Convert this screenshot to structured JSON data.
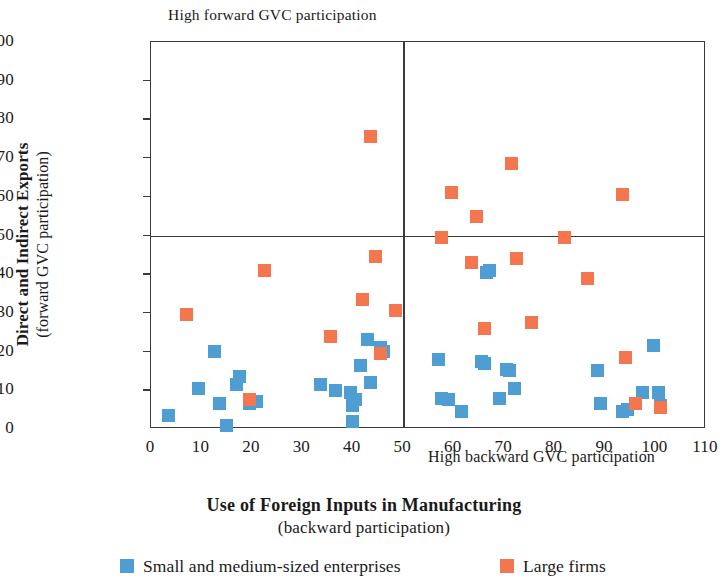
{
  "chart_data": {
    "type": "scatter",
    "title": "",
    "top_annotation": "High forward  GVC participation",
    "x_annotation": "High backward GVC participation",
    "xlabel_bold": "Use of Foreign Inputs in Manufacturing",
    "xlabel_sub": "(backward participation)",
    "ylabel_bold": "Direct and Indirect Exports",
    "ylabel_sub": "(forward GVC participation)",
    "xlim": [
      0,
      110
    ],
    "ylim": [
      0,
      100
    ],
    "xticks": [
      0,
      10,
      20,
      30,
      40,
      50,
      60,
      70,
      80,
      90,
      100,
      110
    ],
    "yticks": [
      0,
      10,
      20,
      30,
      40,
      50,
      60,
      70,
      80,
      90,
      100
    ],
    "grid": false,
    "quadrant_lines": {
      "x": 50,
      "y": 50
    },
    "legend_position": "bottom",
    "colors": {
      "sme": "#4e9ed4",
      "large": "#f4764e",
      "axis": "#3a3a3a"
    },
    "series": [
      {
        "name": "Small and medium-sized enterprises",
        "color": "#4e9ed4",
        "points": [
          [
            3.5,
            3.5
          ],
          [
            9.5,
            10.5
          ],
          [
            12.5,
            20.0
          ],
          [
            13.5,
            6.5
          ],
          [
            15.0,
            1.0
          ],
          [
            17.0,
            11.5
          ],
          [
            17.5,
            13.5
          ],
          [
            19.5,
            6.5
          ],
          [
            21.0,
            7.0
          ],
          [
            33.5,
            11.5
          ],
          [
            36.5,
            10.0
          ],
          [
            39.5,
            9.5
          ],
          [
            40.0,
            2.0
          ],
          [
            40.0,
            6.0
          ],
          [
            40.5,
            7.5
          ],
          [
            41.5,
            16.5
          ],
          [
            43.0,
            23.0
          ],
          [
            43.5,
            12.0
          ],
          [
            45.5,
            21.0
          ],
          [
            46.0,
            20.0
          ],
          [
            57.0,
            18.0
          ],
          [
            57.5,
            8.0
          ],
          [
            59.0,
            7.5
          ],
          [
            61.5,
            4.5
          ],
          [
            65.5,
            17.5
          ],
          [
            66.0,
            17.0
          ],
          [
            66.5,
            40.5
          ],
          [
            67.0,
            41.0
          ],
          [
            69.0,
            8.0
          ],
          [
            70.5,
            15.5
          ],
          [
            71.0,
            15.0
          ],
          [
            72.0,
            10.5
          ],
          [
            88.5,
            15.0
          ],
          [
            89.0,
            6.5
          ],
          [
            93.5,
            4.5
          ],
          [
            94.5,
            5.0
          ],
          [
            97.5,
            9.5
          ],
          [
            99.5,
            21.5
          ],
          [
            100.5,
            9.5
          ],
          [
            101.0,
            6.0
          ]
        ]
      },
      {
        "name": "Large firms",
        "color": "#f4764e",
        "points": [
          [
            7.0,
            29.5
          ],
          [
            19.5,
            7.5
          ],
          [
            22.5,
            41.0
          ],
          [
            35.5,
            24.0
          ],
          [
            42.0,
            33.5
          ],
          [
            43.5,
            75.5
          ],
          [
            44.5,
            44.5
          ],
          [
            45.5,
            19.5
          ],
          [
            48.5,
            30.5
          ],
          [
            57.5,
            49.5
          ],
          [
            59.5,
            61.0
          ],
          [
            63.5,
            43.0
          ],
          [
            64.5,
            55.0
          ],
          [
            66.0,
            26.0
          ],
          [
            71.5,
            68.5
          ],
          [
            72.5,
            44.0
          ],
          [
            75.5,
            27.5
          ],
          [
            82.0,
            49.5
          ],
          [
            86.5,
            39.0
          ],
          [
            93.5,
            60.5
          ],
          [
            94.0,
            18.5
          ],
          [
            96.0,
            6.5
          ],
          [
            101.0,
            5.5
          ]
        ]
      }
    ]
  },
  "legend": {
    "items": [
      {
        "label": "Small and medium-sized enterprises",
        "key": "sme"
      },
      {
        "label": "Large firms",
        "key": "large"
      }
    ]
  }
}
